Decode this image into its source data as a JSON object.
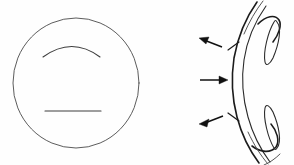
{
  "figure": {
    "background_color": "#fefefe",
    "ink_color": "#1b1b1b",
    "light_ink_color": "#4a4a4a",
    "width": 294,
    "height": 165,
    "panel_count": 2
  },
  "panels": {
    "left": {
      "name": "frontal-view",
      "label": "",
      "shape": "circle",
      "circle": {
        "center_x": 76,
        "center_y": 83,
        "radius_x": 63,
        "radius_y": 65
      },
      "marks": [
        {
          "name": "upper-arc",
          "type": "arc",
          "description": "shallow arc curving downward-open",
          "start_x": 43,
          "start_y": 57,
          "end_x": 100,
          "end_y": 57,
          "apex_x": 72,
          "apex_y": 44
        },
        {
          "name": "lower-line",
          "type": "line",
          "description": "straight horizontal stroke",
          "start_x": 45,
          "start_y": 111,
          "end_x": 101,
          "end_y": 111
        }
      ]
    },
    "right": {
      "name": "cross-section-view",
      "label": "",
      "shape": "curved-band",
      "description": "sagittal cross-section of a curved band with folded ends and two teardrop bodies",
      "arrows": [
        {
          "name": "arrow-upper",
          "direction": "up-left",
          "points_to": "upper band wall",
          "tip_x": 199,
          "tip_y": 38,
          "tail_x": 222,
          "tail_y": 47
        },
        {
          "name": "arrow-middle",
          "direction": "right",
          "points_to": "band apex",
          "tip_x": 227,
          "tip_y": 80,
          "tail_x": 200,
          "tail_y": 80
        },
        {
          "name": "arrow-lower",
          "direction": "down-left",
          "points_to": "lower band wall",
          "tip_x": 199,
          "tip_y": 124,
          "tail_x": 223,
          "tail_y": 115
        }
      ],
      "ticks": [
        {
          "name": "tick-upper",
          "x": 233,
          "y": 46
        },
        {
          "name": "tick-lower",
          "x": 233,
          "y": 117
        }
      ],
      "teardrops": [
        {
          "name": "teardrop-upper",
          "center_x": 272,
          "center_y": 44
        },
        {
          "name": "teardrop-lower",
          "center_x": 272,
          "center_y": 122
        }
      ]
    }
  },
  "accessibility": {
    "alt": "Line drawing: at left a circle containing a shallow downward-open arc above a straight horizontal line; at right a cross-sectional view of a curved band with hooked ends, two narrow teardrop shapes, and three arrows pointing toward the band."
  }
}
